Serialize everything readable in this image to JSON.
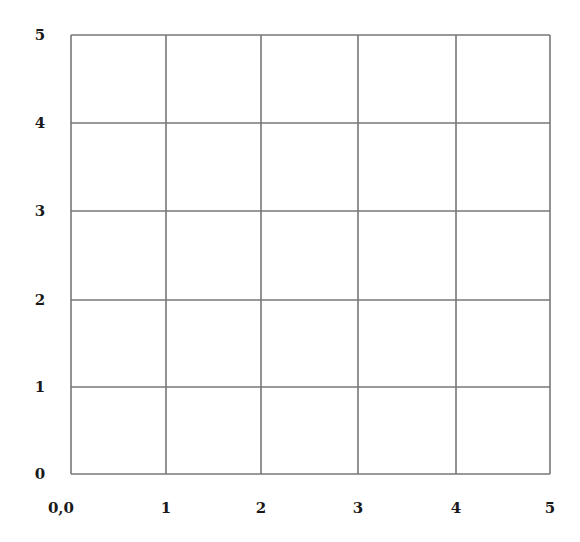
{
  "chart_data": {
    "type": "grid",
    "title": "",
    "xlabel": "",
    "ylabel": "",
    "xlim": [
      0,
      5
    ],
    "ylim": [
      0,
      5
    ],
    "grid": true,
    "x_ticks": [
      0,
      1,
      2,
      3,
      4,
      5
    ],
    "y_ticks": [
      0,
      1,
      2,
      3,
      4,
      5
    ],
    "x_tick_labels": [
      "0,0",
      "1",
      "2",
      "3",
      "4",
      "5"
    ],
    "y_tick_labels": [
      "0",
      "1",
      "2",
      "3",
      "4",
      "5"
    ],
    "series": [],
    "colors": {
      "grid": "#777777",
      "labels": "#1a1a1a",
      "background": "#ffffff"
    }
  },
  "layout": {
    "x_pixels": [
      71,
      166,
      261,
      358,
      456,
      550
    ],
    "y_pixels": [
      474,
      387,
      300,
      211,
      123,
      35
    ],
    "x_label_y": 513,
    "y_label_x": 40
  }
}
